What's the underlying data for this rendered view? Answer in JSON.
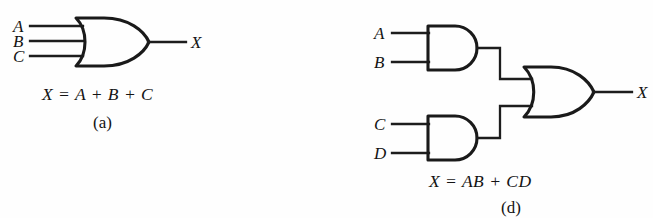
{
  "figure": {
    "background_color": "#fefefe",
    "ink_color": "#1a1a1a",
    "panels": [
      {
        "id": "a",
        "caption": "(a)",
        "equation": "X  =  A  +  B  +  C",
        "gate_type": "OR",
        "inputs": [
          "A",
          "B",
          "C"
        ],
        "output": "X"
      },
      {
        "id": "d",
        "caption": "(d)",
        "equation": "X  =  AB  +  CD",
        "gate_type": "AND-OR",
        "inputs": [
          "A",
          "B",
          "C",
          "D"
        ],
        "output": "X"
      }
    ]
  },
  "panel_a": {
    "input_a": "A",
    "input_b": "B",
    "input_c": "C",
    "output_x": "X",
    "equation": "X  =  A  +  B  +  C",
    "caption": "(a)",
    "gate_label": "or-gate"
  },
  "panel_d": {
    "input_a": "A",
    "input_b": "B",
    "input_c": "C",
    "input_d": "D",
    "output_x": "X",
    "equation": "X  =  AB  +  CD",
    "caption": "(d)",
    "gate_top_label": "and-gate-top",
    "gate_bottom_label": "and-gate-bottom",
    "gate_or_label": "or-gate"
  }
}
